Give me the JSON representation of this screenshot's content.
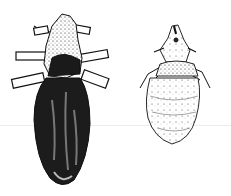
{
  "image": {
    "width": 231,
    "height": 196,
    "background": "#ffffff",
    "ink_color": "#111111",
    "subjects": [
      {
        "name": "louse-dark",
        "description": "dark, densely stippled louse with six legs, dorsal view",
        "position": "left"
      },
      {
        "name": "louse-light",
        "description": "lighter, sparsely stippled louse, dorsal view",
        "position": "right"
      }
    ]
  }
}
